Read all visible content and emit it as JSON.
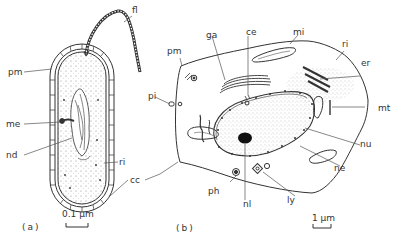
{
  "figure": {
    "panel_a": {
      "caption": "(a)",
      "scale_label": "0.1 μm",
      "labels": {
        "fl": "fl",
        "pm": "pm",
        "me": "me",
        "nd": "nd",
        "ri": "ri",
        "cc": "cc"
      }
    },
    "panel_b": {
      "caption": "(b)",
      "scale_label": "1 μm",
      "labels": {
        "pm": "pm",
        "ga": "ga",
        "ce": "ce",
        "mi": "mi",
        "ri": "ri",
        "er": "er",
        "mt": "mt",
        "pi": "pi",
        "nu": "nu",
        "ne": "ne",
        "ph": "ph",
        "nl": "nl",
        "ly": "ly"
      }
    },
    "colors": {
      "line": "#333333",
      "stipple": "#666666"
    }
  }
}
